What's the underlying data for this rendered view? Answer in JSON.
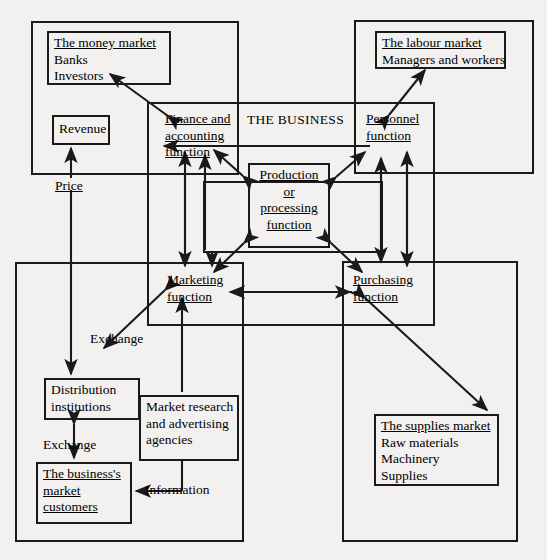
{
  "diagram": {
    "title": "THE BUSINESS",
    "background_color": "#f2f1ef",
    "line_color": "#1a1a1a",
    "type": "block-flow-diagram",
    "frames": [
      {
        "name": "money-market-frame",
        "x": 32,
        "y": 22,
        "w": 206,
        "h": 152
      },
      {
        "name": "labour-market-frame",
        "x": 355,
        "y": 21,
        "w": 178,
        "h": 152
      },
      {
        "name": "the-business-frame",
        "x": 148,
        "y": 103,
        "w": 286,
        "h": 222
      },
      {
        "name": "customer-market-frame",
        "x": 16,
        "y": 263,
        "w": 227,
        "h": 278
      },
      {
        "name": "supplies-market-frame",
        "x": 343,
        "y": 262,
        "w": 174,
        "h": 279
      },
      {
        "name": "production-inner-frame",
        "x": 204,
        "y": 182,
        "w": 178,
        "h": 70
      }
    ],
    "boxes": [
      {
        "name": "money-market-box",
        "x": 47,
        "y": 31,
        "w": 124,
        "h": 54,
        "heading": "The money market",
        "lines": [
          "Banks",
          "Investors"
        ]
      },
      {
        "name": "revenue-box",
        "x": 52,
        "y": 115,
        "w": 58,
        "h": 30,
        "heading": null,
        "lines": [
          "Revenue"
        ],
        "centered": true
      },
      {
        "name": "labour-market-box",
        "x": 375,
        "y": 31,
        "w": 131,
        "h": 38,
        "heading": "The labour market",
        "lines": [
          "Managers and workers"
        ]
      },
      {
        "name": "production-function-box",
        "x": 248,
        "y": 163,
        "w": 82,
        "h": 85,
        "heading": null,
        "lines": [
          "Production",
          "or",
          "processing",
          "function"
        ],
        "underline_all": true,
        "centered": true
      },
      {
        "name": "distribution-institutions-box",
        "x": 44,
        "y": 378,
        "w": 96,
        "h": 42,
        "heading": null,
        "lines": [
          "Distribution",
          "institutions"
        ]
      },
      {
        "name": "market-research-box",
        "x": 139,
        "y": 395,
        "w": 100,
        "h": 66,
        "heading": null,
        "lines": [
          "Market research",
          "and advertising",
          "agencies"
        ]
      },
      {
        "name": "business-customers-box",
        "x": 36,
        "y": 462,
        "w": 96,
        "h": 62,
        "heading": "The business's",
        "lines": [
          "market",
          "customers"
        ],
        "underline_all": true
      },
      {
        "name": "supplies-market-box",
        "x": 374,
        "y": 414,
        "w": 125,
        "h": 72,
        "heading": "The supplies market",
        "lines": [
          "Raw materials",
          "Machinery",
          "Supplies"
        ]
      }
    ],
    "function_labels": [
      {
        "name": "finance-accounting-function",
        "x": 165,
        "y": 111,
        "lines": [
          "Finance and",
          "accounting",
          "function"
        ]
      },
      {
        "name": "personnel-function",
        "x": 366,
        "y": 111,
        "lines": [
          "Personnel",
          "function"
        ]
      },
      {
        "name": "marketing-function",
        "x": 167,
        "y": 272,
        "lines": [
          "Marketing",
          "function"
        ]
      },
      {
        "name": "purchasing-function",
        "x": 353,
        "y": 272,
        "lines": [
          "Purchasing",
          "function"
        ]
      }
    ],
    "edge_labels": [
      {
        "name": "price-label",
        "text": "Price",
        "x": 55,
        "y": 178,
        "underlined": true
      },
      {
        "name": "exchange-label-top",
        "text": "Exchange",
        "x": 90,
        "y": 331,
        "underlined": false
      },
      {
        "name": "exchange-label-bottom",
        "text": "Exchange",
        "x": 43,
        "y": 437,
        "underlined": false
      },
      {
        "name": "information-label",
        "text": "Information",
        "x": 145,
        "y": 491,
        "underlined": false
      }
    ],
    "business_title_pos": {
      "x": 247,
      "y": 112
    }
  }
}
